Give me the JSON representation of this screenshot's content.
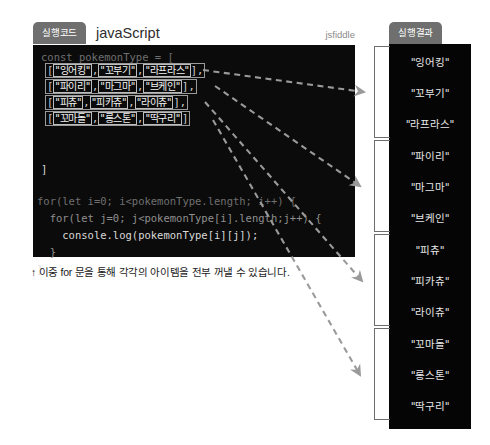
{
  "editor": {
    "tab_label": "실행코드",
    "language_label": "javaScript",
    "source_label": "jsfiddle",
    "code": {
      "declaration": "const pokemonType = [",
      "close_bracket": "]",
      "loop_line_1": "for(let i=0; i<pokemonType.length; i++) {",
      "loop_line_2": "  for(let j=0; j<pokemonType[i].length;j++) {",
      "loop_line_3": "    console.log(pokemonType[i][j]);",
      "loop_line_4": "  }",
      "loop_line_5": "}"
    },
    "array_rows": [
      {
        "open": "[",
        "items": [
          "\"잉어킹\"",
          "\"꼬부기\"",
          "\"라프라스\""
        ],
        "close": "],"
      },
      {
        "open": "[",
        "items": [
          "\"파이리\"",
          "\"마그마\"",
          "\"브케인\""
        ],
        "close": "],"
      },
      {
        "open": "[",
        "items": [
          "\"피츄\"",
          "\"피카츄\"",
          "\"라이츄\""
        ],
        "close": "],"
      },
      {
        "open": "[",
        "items": [
          "\"꼬마돌\"",
          "\"롱스톤\"",
          "\"딱구리\""
        ],
        "close": "]"
      }
    ]
  },
  "caption": "↑ 이중 for 문을 통해 각각의 아이템을 전부 꺼낼 수 있습니다.",
  "result": {
    "tab_label": "실행결과",
    "items": [
      "\"잉어킹\"",
      "\"꼬부기\"",
      "\"라프라스\"",
      "\"파이리\"",
      "\"마그마\"",
      "\"브케인\"",
      "\"피츄\"",
      "\"피카츄\"",
      "\"라이츄\"",
      "\"꼬마돌\"",
      "\"롱스톤\"",
      "\"딱구리\""
    ],
    "group_count": 4
  },
  "colors": {
    "code_background": "#0b0b0b",
    "result_background": "#050505",
    "tab_background": "#6f6f6f",
    "arrow": "#9a9a9a",
    "page_background": "#ffffff"
  }
}
